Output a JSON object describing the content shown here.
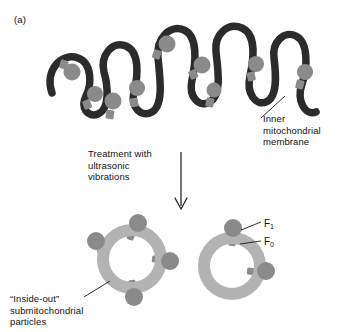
{
  "figure": {
    "panel_label": "(a)",
    "background_color": "#ffffff"
  },
  "labels": {
    "membrane": "Inner\nmitochondrial\nmembrane",
    "treatment": "Treatment with\nultrasonic\nvibrations",
    "particles": "“Inside-out”\nsubmitochondrial\nparticles",
    "f1": "F",
    "f1_sub": "1",
    "f0": "F",
    "f0_sub": "0"
  },
  "icons": {
    "arrow": "down-arrow-icon",
    "membrane": "membrane-curve-icon",
    "vesicle_left": "vesicle-icon",
    "vesicle_right": "vesicle-icon"
  },
  "colors": {
    "membrane_dark": "#2b2b2b",
    "particle_gray": "#8a8a8a",
    "vesicle_ring_gray": "#b3b3b3",
    "leader_line": "#1a1a1a",
    "text": "#111111"
  },
  "diagram_data": {
    "type": "biological-schematic",
    "subject": "Inner mitochondrial membrane converted to inside-out submitochondrial particles",
    "process_step": "Treatment with ultrasonic vibrations",
    "membrane_particle_count": 9,
    "vesicles": [
      {
        "name": "inside-out-particle-left",
        "knob_count": 4,
        "orientation": "knobs-outward"
      },
      {
        "name": "inside-out-particle-right",
        "knob_count": 2,
        "orientation": "knobs-outward"
      }
    ],
    "complex_parts": [
      "F1",
      "F0"
    ]
  }
}
